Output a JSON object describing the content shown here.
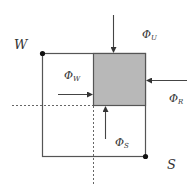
{
  "diagram": {
    "labels": {
      "corner_w": "W",
      "corner_s": "S",
      "phi_symbol": "Φ",
      "flux_u_sub": "U",
      "flux_w_sub": "W",
      "flux_r_sub": "R",
      "flux_s_sub": "S"
    },
    "colors": {
      "line": "#555555",
      "cell_fill": "#b8b8b8",
      "text": "#333333",
      "background": "#ffffff"
    }
  }
}
